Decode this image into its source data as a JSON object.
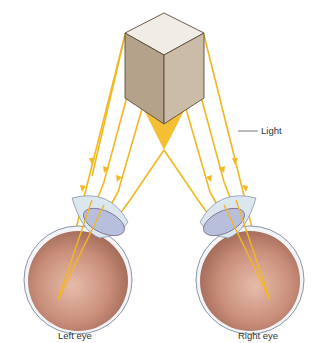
{
  "diagram": {
    "type": "binocular-vision-illustration",
    "object": "cube",
    "labels": {
      "light": "Light",
      "left_eye": "Left eye",
      "right_eye": "Right eye"
    },
    "colors": {
      "light_ray": "#f2b81f",
      "cube_top": "#ece8e2",
      "cube_left": "#b5a48c",
      "cube_right": "#c9bba7",
      "eyeball": "#c9917e",
      "lens": "#b9c2dd",
      "cornea": "#dfe8f1"
    }
  }
}
